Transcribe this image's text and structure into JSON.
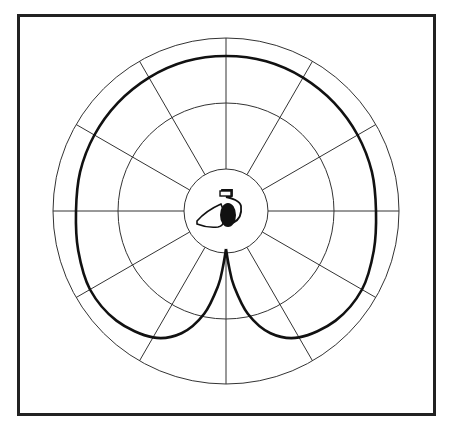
{
  "diagram": {
    "type": "polar-pickup-pattern",
    "center": [
      226,
      211
    ],
    "grid": {
      "rings": [
        42,
        108,
        173
      ],
      "spoke_step_deg": 30,
      "spoke_count": 12,
      "line_color": "#333333"
    },
    "pattern": {
      "name": "cardioid",
      "stroke_color": "#111111",
      "stroke_width": 2.6,
      "samples_deg": [
        0,
        15,
        30,
        45,
        60,
        75,
        90,
        105,
        120,
        135,
        150,
        160,
        168,
        174,
        177,
        180
      ],
      "samples_r": [
        155,
        155,
        154,
        153,
        152,
        151,
        150,
        153,
        157,
        155,
        146,
        130,
        105,
        75,
        55,
        38
      ]
    },
    "center_icon": {
      "name": "hand-holding-microphone-icon",
      "fill": "#111111"
    }
  }
}
